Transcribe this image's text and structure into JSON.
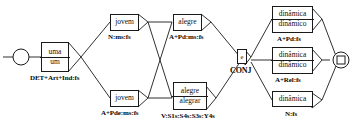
{
  "diagram": {
    "start_node": {
      "name": "start-node",
      "shape": "circle"
    },
    "end_node": {
      "name": "end-node",
      "shape": "double-circle-square"
    },
    "nodes": [
      {
        "id": "det",
        "words": [
          "uma",
          "um"
        ],
        "label": "DET+Art+Ind:fs"
      },
      {
        "id": "jovem-noun",
        "words": [
          "jovem"
        ],
        "label": "N:ms:fs"
      },
      {
        "id": "jovem-adj",
        "words": [
          "jovem"
        ],
        "label": "A+Pde:ms:fs"
      },
      {
        "id": "alegre-adj",
        "words": [
          "alegre"
        ],
        "label": "A+Pd:ms:fs"
      },
      {
        "id": "alegre-verb",
        "words": [
          "alegre",
          "alegrar"
        ],
        "label": "V:S1s:S4s:S3s:Y4s"
      },
      {
        "id": "conj",
        "words": [
          "e"
        ],
        "label": "CONJ"
      },
      {
        "id": "dinamica-pd",
        "words": [
          "dinâmica",
          "dinâmico"
        ],
        "label": "A+Pd:fs"
      },
      {
        "id": "dinamica-rel",
        "words": [
          "dinâmica",
          "dinâmico"
        ],
        "label": "A+Rel:fs"
      },
      {
        "id": "dinamica-noun",
        "words": [
          "dinâmica"
        ],
        "label": "N:fs"
      }
    ],
    "colors": {
      "stroke": "#1a1a1a",
      "text": "#111111",
      "background": "#ffffff"
    }
  }
}
